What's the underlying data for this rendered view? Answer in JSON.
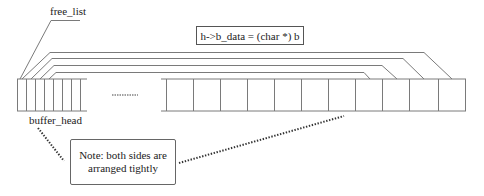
{
  "labels": {
    "free_list": "free_list",
    "buffer_head": "buffer_head",
    "formula": "h->b_data = (char *) b",
    "note_line1": "Note: both sides are",
    "note_line2": "arranged tightly"
  },
  "colors": {
    "line": "#7a7a7a",
    "dots": "#333333",
    "background": "#ffffff"
  }
}
